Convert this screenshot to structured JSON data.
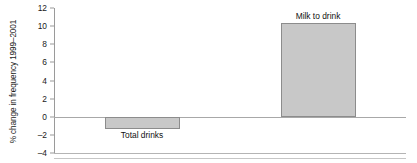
{
  "chart_data": {
    "type": "bar",
    "title": "",
    "subtitle": "",
    "xlabel": "",
    "ylabel": "% change in frequency 1999–2001",
    "categories": [
      "Total drinks",
      "Milk to drink"
    ],
    "values": [
      -1.4,
      10.3
    ],
    "series": [
      {
        "name": "% change in frequency 1999–2001",
        "values": [
          -1.4,
          10.3
        ]
      }
    ],
    "ylim": [
      -4,
      12
    ],
    "y_ticks": [
      12,
      10,
      8,
      6,
      4,
      2,
      0,
      -2,
      -4
    ],
    "y_tick_labels": [
      "12",
      "10",
      "8",
      "6",
      "4",
      "2",
      "0",
      "–2",
      "–4"
    ],
    "grid": false,
    "legend": false,
    "legend_position": "none",
    "annotations": [
      {
        "text": "Total drinks",
        "category": "Total drinks",
        "placement": "below-bar"
      },
      {
        "text": "Milk to drink",
        "category": "Milk to drink",
        "placement": "above-bar"
      }
    ],
    "colors": {
      "bar_fill": "#c8c8c8",
      "bar_border": "#8c8c8c",
      "axis_line": "#9a9a9a",
      "zero_line": "#a8a8a8",
      "text": "#1a1a1a",
      "background": "#ffffff"
    }
  }
}
